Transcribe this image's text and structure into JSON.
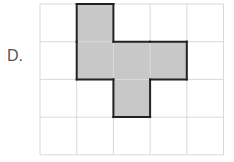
{
  "option_label": "D.",
  "grid": {
    "cols": 5,
    "rows": 4,
    "left": 40,
    "top": 4,
    "cell_w": 36.7,
    "cell_h": 37.7,
    "line_color": "#d9d9d9"
  },
  "shape": {
    "cells": [
      [
        1,
        0
      ],
      [
        1,
        1
      ],
      [
        2,
        1
      ],
      [
        3,
        1
      ],
      [
        2,
        2
      ]
    ],
    "fill": "#c8c8c8",
    "stroke": "#222222"
  }
}
